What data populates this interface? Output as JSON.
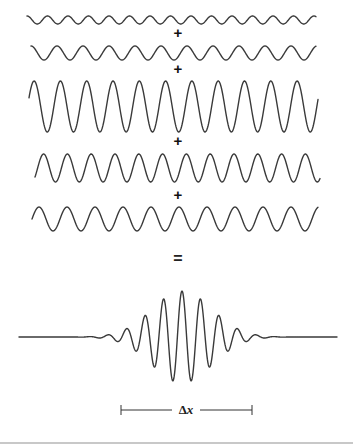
{
  "diagram": {
    "stroke_color": "#3a3a3a",
    "component_waves": [
      {
        "x_start": 27,
        "x_end": 316,
        "center_y": 20,
        "amplitude": 4,
        "period": 20.5,
        "phase_deg": 90
      },
      {
        "x_start": 31,
        "x_end": 316,
        "center_y": 53,
        "amplitude": 7,
        "period": 26,
        "phase_deg": 90
      },
      {
        "x_start": 29,
        "x_end": 318,
        "center_y": 106.5,
        "amplitude": 25.5,
        "period": 26.3,
        "phase_deg": 20
      },
      {
        "x_start": 35,
        "x_end": 320,
        "center_y": 168,
        "amplitude": 14,
        "period": 23.8,
        "phase_deg": -40
      },
      {
        "x_start": 32,
        "x_end": 318,
        "center_y": 219,
        "amplitude": 12,
        "period": 28,
        "phase_deg": 0
      }
    ],
    "operators": [
      {
        "symbol": "+",
        "x": 178,
        "y": 38
      },
      {
        "symbol": "+",
        "x": 178,
        "y": 74
      },
      {
        "symbol": "+",
        "x": 178,
        "y": 146
      },
      {
        "symbol": "+",
        "x": 178,
        "y": 200
      }
    ],
    "equals": {
      "symbol": "=",
      "x": 178,
      "y": 264
    },
    "packet": {
      "x_start": 19,
      "x_end": 337,
      "baseline_y": 337,
      "center_x": 182,
      "amplitude": 46,
      "period": 18.5,
      "envelope_sigma": 30
    },
    "width_label": {
      "text": "Δx",
      "x_left": 121,
      "x_right": 252,
      "y": 410,
      "gap_left": 172,
      "gap_right": 200
    },
    "footer_rule_y": 443
  }
}
